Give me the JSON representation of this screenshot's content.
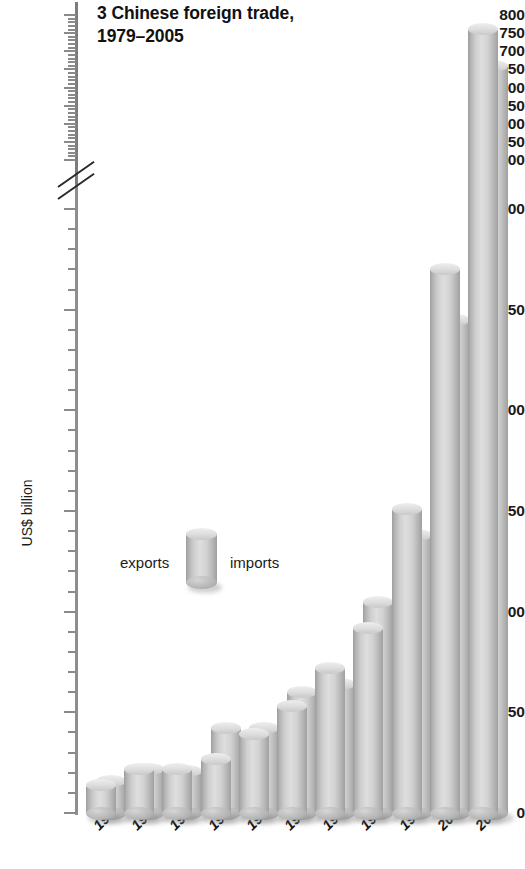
{
  "chart_data": {
    "type": "bar",
    "title": "3 Chinese foreign trade, 1979–2005",
    "title_line1": "3 Chinese foreign trade,",
    "title_line2": "1979–2005",
    "xlabel": "",
    "ylabel": "US$ billion",
    "categories": [
      "1979",
      "1981",
      "1983",
      "1985",
      "1987",
      "1989",
      "1991",
      "1993",
      "1996",
      "2000",
      "2005"
    ],
    "series": [
      {
        "name": "exports",
        "values": [
          14,
          22,
          22,
          27,
          39,
          53,
          72,
          92,
          151,
          270,
          762
        ]
      },
      {
        "name": "imports",
        "values": [
          16,
          22,
          21,
          42,
          42,
          60,
          64,
          105,
          138,
          245,
          660
        ]
      }
    ],
    "legend": {
      "position": "inside-left",
      "entries": [
        "exports",
        "imports"
      ]
    },
    "y_axis": {
      "ylim": [
        0,
        800
      ],
      "major_ticks": [
        0,
        50,
        100,
        150,
        200,
        250,
        300,
        400,
        450,
        500,
        550,
        600,
        650,
        700,
        750,
        800
      ],
      "minor_tick_step": 10,
      "axis_break_between": [
        300,
        400
      ],
      "has_axis_break": true
    },
    "grid": false,
    "colors": {
      "bar_light": "#dedede",
      "bar_mid": "#c4c4c4",
      "bar_dark": "#9d9d9d",
      "text": "#1a1a1a",
      "axis": "#8a8a8a",
      "background": "#ffffff"
    }
  }
}
